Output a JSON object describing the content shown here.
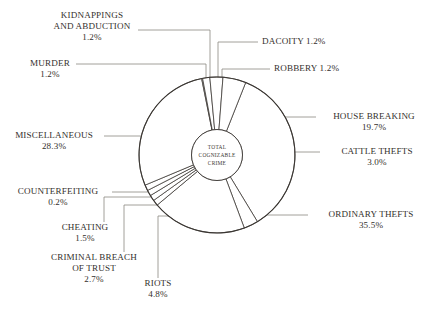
{
  "chart": {
    "type": "pie",
    "center_label_lines": [
      "TOTAL",
      "COGNIZABLE",
      "CRIME"
    ],
    "stroke_color": "#3a3632",
    "leader_color": "#8c8880",
    "text_color": "#332f2c",
    "background": "#ffffff"
  },
  "chart_data": {
    "type": "pie",
    "title": "",
    "categories": [
      "ORDINARY THEFTS",
      "CATTLE THEFTS",
      "HOUSE BREAKING",
      "ROBBERY",
      "DACOITY",
      "KIDNAPPINGS AND ABDUCTION",
      "MURDER",
      "MISCELLANEOUS",
      "COUNTERFEITING",
      "CHEATING",
      "CRIMINAL BREACH OF TRUST",
      "RIOTS"
    ],
    "values": [
      35.5,
      3.0,
      19.7,
      1.2,
      1.2,
      1.2,
      1.2,
      28.3,
      0.2,
      1.5,
      2.7,
      4.8
    ],
    "unit": "%",
    "center_label": "TOTAL COGNIZABLE CRIME",
    "legend": "callout labels with leader lines",
    "slices": [
      {
        "label": "ORDINARY THEFTS",
        "value": 35.5,
        "pct_text": "35.5%"
      },
      {
        "label": "CATTLE THEFTS",
        "value": 3.0,
        "pct_text": "3.0%"
      },
      {
        "label": "HOUSE BREAKING",
        "value": 19.7,
        "pct_text": "19.7%"
      },
      {
        "label": "ROBBERY",
        "value": 1.2,
        "pct_text": "1.2%"
      },
      {
        "label": "DACOITY",
        "value": 1.2,
        "pct_text": "1.2%"
      },
      {
        "label": "KIDNAPPINGS AND ABDUCTION",
        "value": 1.2,
        "pct_text": "1.2%"
      },
      {
        "label": "MURDER",
        "value": 1.2,
        "pct_text": "1.2%"
      },
      {
        "label": "MISCELLANEOUS",
        "value": 28.3,
        "pct_text": "28.3%"
      },
      {
        "label": "COUNTERFEITING",
        "value": 0.2,
        "pct_text": "0.2%"
      },
      {
        "label": "CHEATING",
        "value": 1.5,
        "pct_text": "1.5%"
      },
      {
        "label": "CRIMINAL BREACH OF TRUST",
        "value": 2.7,
        "pct_text": "2.7%"
      },
      {
        "label": "RIOTS",
        "value": 4.8,
        "pct_text": "4.8%"
      }
    ]
  },
  "labels": {
    "kidnappings": {
      "line1": "KIDNAPPINGS",
      "line2": "AND ABDUCTION",
      "pct": "1.2%"
    },
    "murder": {
      "line1": "MURDER",
      "pct": "1.2%"
    },
    "dacoity": {
      "text": "DACOITY 1.2%"
    },
    "robbery": {
      "text": "ROBBERY 1.2%"
    },
    "house_breaking": {
      "line1": "HOUSE BREAKING",
      "pct": "19.7%"
    },
    "cattle_thefts": {
      "line1": "CATTLE THEFTS",
      "pct": "3.0%"
    },
    "ordinary_thefts": {
      "line1": "ORDINARY THEFTS",
      "pct": "35.5%"
    },
    "miscellaneous": {
      "line1": "MISCELLANEOUS",
      "pct": "28.3%"
    },
    "counterfeiting": {
      "line1": "COUNTERFEITING",
      "pct": "0.2%"
    },
    "cheating": {
      "line1": "CHEATING",
      "pct": "1.5%"
    },
    "criminal_breach": {
      "line1": "CRIMINAL BREACH",
      "line2": "OF TRUST",
      "pct": "2.7%"
    },
    "riots": {
      "line1": "RIOTS",
      "pct": "4.8%"
    }
  },
  "hub": {
    "l1": "TOTAL",
    "l2": "COGNIZABLE",
    "l3": "CRIME"
  }
}
